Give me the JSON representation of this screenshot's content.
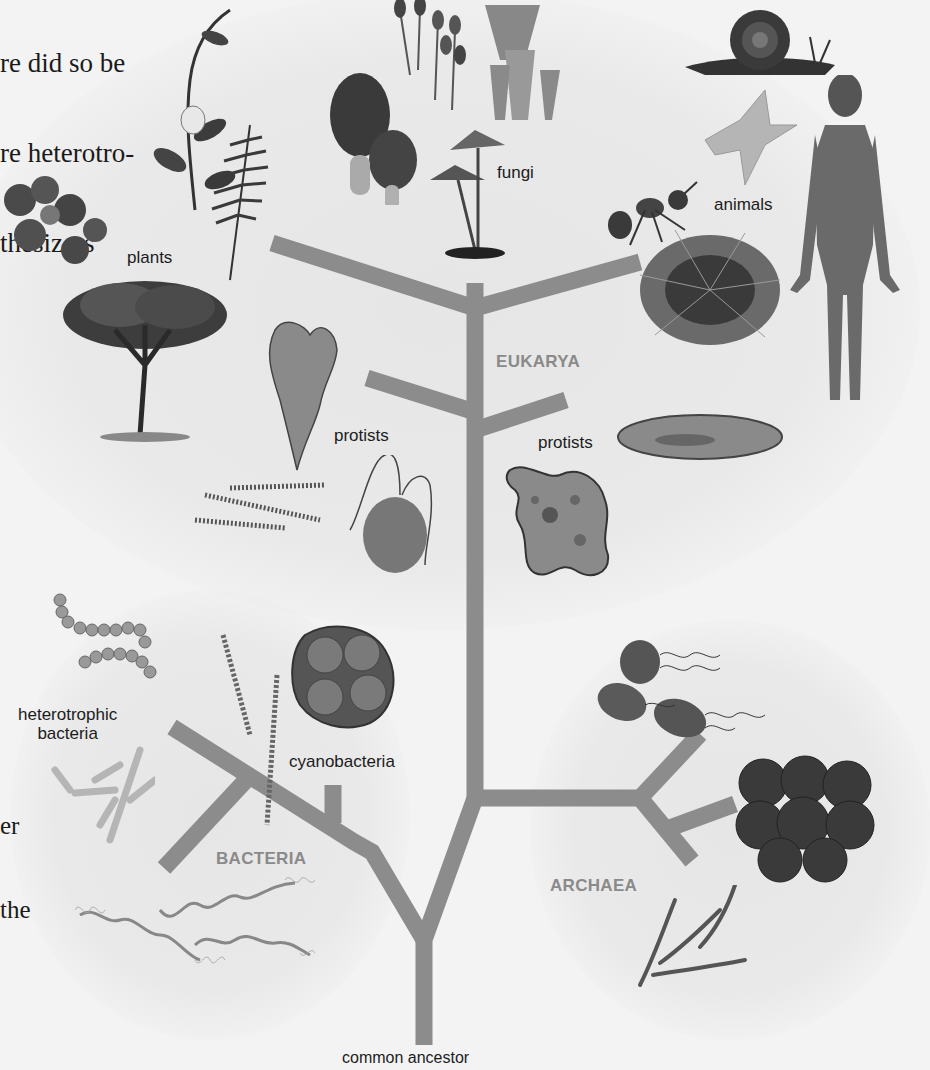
{
  "page_text_fragments": {
    "top_left": [
      "re did so be",
      "re heterotro-",
      "thesizers"
    ],
    "mid_left": [
      "er",
      "the"
    ]
  },
  "tree": {
    "branch_color": "#8c8c8c",
    "root_label": "common ancestor",
    "domains": [
      {
        "name": "EUKARYA"
      },
      {
        "name": "BACTERIA"
      },
      {
        "name": "ARCHAEA"
      }
    ]
  },
  "groups": {
    "plants": "plants",
    "fungi": "fungi",
    "animals": "animals",
    "protists_left": "protists",
    "protists_right": "protists",
    "heterotrophic_bacteria_line1": "heterotrophic",
    "heterotrophic_bacteria_line2": "bacteria",
    "cyanobacteria": "cyanobacteria"
  },
  "organisms": {
    "plants": [
      "vine with flower",
      "clover",
      "fern",
      "tree"
    ],
    "fungi": [
      "morels",
      "stalked fungi",
      "cup fungi",
      "mushrooms"
    ],
    "animals": [
      "snail",
      "sea star",
      "ant",
      "sea urchin",
      "human"
    ],
    "protists": [
      "algae",
      "diatom chains",
      "flagellate",
      "amoeba",
      "paramecium"
    ],
    "bacteria": [
      "cocci chains",
      "rods",
      "spirochetes",
      "cyanobacteria filaments",
      "cyanobacteria colony"
    ],
    "archaea": [
      "flagellated cells",
      "cell cluster",
      "filaments"
    ]
  }
}
